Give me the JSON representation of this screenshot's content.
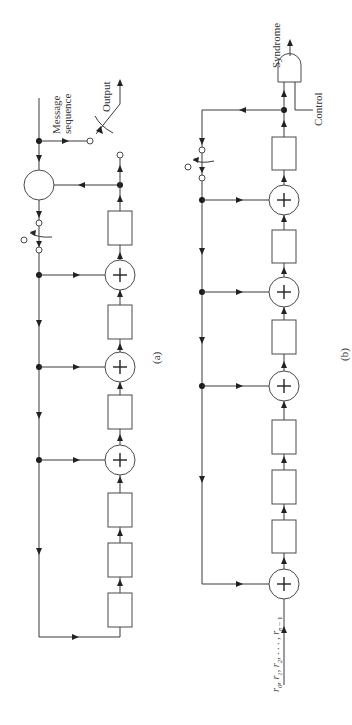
{
  "figure": {
    "panel_a": {
      "caption": "(a)",
      "input_label_line1": "Message",
      "input_label_line2": "sequence",
      "output_label": "Output",
      "shift_register_stages": 7,
      "adders": 3
    },
    "panel_b": {
      "caption": "(b)",
      "output_label": "Syndrome",
      "control_label": "Control",
      "input_label": "r0, r1, r2, . . . , rn − 1",
      "input_r0": "r",
      "input_sub0": "0",
      "input_sep": ", ",
      "input_sub1": "1",
      "input_sub2": "2",
      "input_dots": ", . . . , ",
      "input_subn": "n",
      "input_minus1": " − 1",
      "shift_register_stages": 7,
      "adders": 4,
      "gate": "AND"
    },
    "colors": {
      "line": "#3a3a3a",
      "dot": "#1a1a1a",
      "background": "#ffffff"
    }
  }
}
